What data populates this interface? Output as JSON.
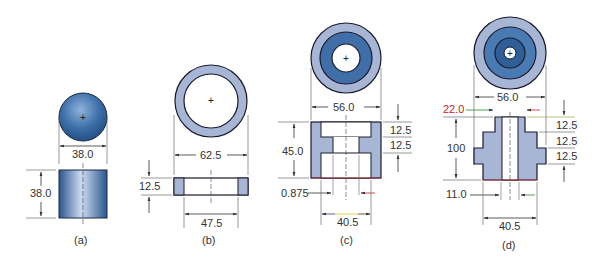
{
  "figure": {
    "colors": {
      "dark_blue": "#2f5f96",
      "mid_blue": "#4a7ab2",
      "light_blue": "#a8b6d6",
      "outline": "#1a1a2e",
      "dim_line": "#333333",
      "accent_red": "#cc2222",
      "accent_green": "#2a8a2a",
      "accent_yellow": "#d8c020",
      "accent_purple": "#4a2a9a"
    },
    "parts": [
      {
        "caption": "(a)",
        "name": "solid cylinder",
        "dims": {
          "diameter": "38.0",
          "height": "38.0"
        }
      },
      {
        "caption": "(b)",
        "name": "ring washer",
        "dims": {
          "outer_diameter": "62.5",
          "thickness": "12.5",
          "inner_diameter": "47.5"
        }
      },
      {
        "caption": "(c)",
        "name": "counterbored bushing",
        "dims": {
          "top_diameter": "56.0",
          "height": "45.0",
          "step1": "12.5",
          "step2": "12.5",
          "wall": "0.875",
          "bottom_diameter": "40.5"
        }
      },
      {
        "caption": "(d)",
        "name": "stepped shaft with bore",
        "dims": {
          "top_diameter": "56.0",
          "top_width": "22.0",
          "height": "100",
          "step1": "12.5",
          "step2": "12.5",
          "step3": "12.5",
          "bore": "11.0",
          "bottom_diameter": "40.5"
        }
      }
    ]
  }
}
